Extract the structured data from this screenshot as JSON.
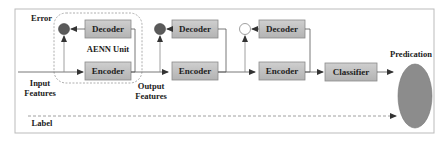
{
  "diagram": {
    "title_labels": {
      "error": "Error",
      "aenn_unit": "AENN Unit",
      "input_features_line1": "Input",
      "input_features_line2": "Features",
      "output_features_line1": "Output",
      "output_features_line2": "Features",
      "prediction": "Predication",
      "label": "Label"
    },
    "units": [
      {
        "decoder": "Decoder",
        "encoder": "Encoder",
        "error_node": "filled"
      },
      {
        "decoder": "Decoder",
        "encoder": "Encoder",
        "error_node": "filled"
      },
      {
        "decoder": "Decoder",
        "encoder": "Encoder",
        "error_node": "hollow"
      }
    ],
    "classifier": "Classifier",
    "colors": {
      "box_fill": "#bdbdbd",
      "box_stroke": "#8a8a8a",
      "node_fill": "#5a5a5a",
      "ellipse_fill": "#8c8c8c",
      "line": "#555555",
      "frame": "#bbbbbb",
      "aenn_border": "#9a9a9a"
    }
  }
}
